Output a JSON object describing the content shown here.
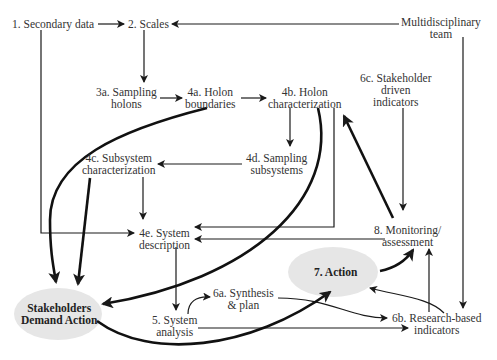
{
  "nodes": {
    "secondary_data": {
      "lines": [
        "1. Secondary data"
      ]
    },
    "scales": {
      "lines": [
        "2. Scales"
      ]
    },
    "multidisciplinary_team": {
      "lines": [
        "Multidisciplinary",
        "team"
      ]
    },
    "sampling_holons": {
      "lines": [
        "3a. Sampling",
        "holons"
      ]
    },
    "holon_boundaries": {
      "lines": [
        "4a. Holon",
        "boundaries"
      ]
    },
    "holon_characterization": {
      "lines": [
        "4b. Holon",
        "characterization"
      ]
    },
    "stakeholder_driven_indicators": {
      "lines": [
        "6c. Stakeholder",
        "driven",
        "indicators"
      ]
    },
    "subsystem_characterization": {
      "lines": [
        "4c. Subsystem",
        "characterization"
      ]
    },
    "sampling_subsystems": {
      "lines": [
        "4d. Sampling",
        "subsystems"
      ]
    },
    "system_description": {
      "lines": [
        "4e. System",
        "description"
      ]
    },
    "monitoring_assessment": {
      "lines": [
        "8. Monitoring/",
        "assessment"
      ]
    },
    "action": {
      "lines": [
        "7. Action"
      ]
    },
    "stakeholders_demand_action": {
      "lines": [
        "Stakeholders",
        "Demand Action"
      ]
    },
    "synthesis_plan": {
      "lines": [
        "6a. Synthesis",
        "& plan"
      ]
    },
    "system_analysis": {
      "lines": [
        "5. System",
        "analysis"
      ]
    },
    "research_based_indicators": {
      "lines": [
        "6b. Research-based",
        "indicators"
      ]
    }
  },
  "colors": {
    "ellipse_fill": "#e6e6e6",
    "stroke": "#1a1a1a",
    "text": "#333333"
  }
}
